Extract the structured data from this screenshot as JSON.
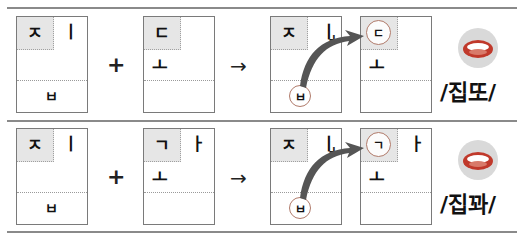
{
  "rows": [
    {
      "box1": {
        "cho": "ㅈ",
        "jung": "ㅣ",
        "jong": "ㅂ"
      },
      "op_plus": "+",
      "box2": {
        "cho": "ㄷ",
        "jung": "",
        "jung_bottom": "ㅗ"
      },
      "op_arrow": "→",
      "box3": {
        "cho": "ㅈ",
        "jung": "ㅣ",
        "plus": "+",
        "jong_circled": "ㅂ"
      },
      "box4": {
        "cho_circled": "ㄷ",
        "jung": "",
        "jung_bottom": "ㅗ"
      },
      "pronunciation": "/집또/"
    },
    {
      "box1": {
        "cho": "ㅈ",
        "jung": "ㅣ",
        "jong": "ㅂ"
      },
      "op_plus": "+",
      "box2": {
        "cho": "ㄱ",
        "jung": "ㅏ",
        "jung_bottom": "ㅗ"
      },
      "op_arrow": "→",
      "box3": {
        "cho": "ㅈ",
        "jung": "ㅣ",
        "plus": "+",
        "jong_circled": "ㅂ"
      },
      "box4": {
        "cho_circled": "ㄱ",
        "jung": "ㅏ",
        "jung_bottom": "ㅗ"
      },
      "pronunciation": "/집꽈/"
    }
  ],
  "icons": {
    "mouth": "mouth-icon"
  },
  "colors": {
    "circle_stroke": "#b07a6a",
    "arrow_fill": "#555555",
    "shade": "#e6e6e6"
  }
}
